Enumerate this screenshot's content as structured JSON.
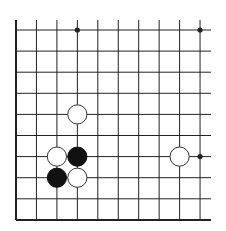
{
  "board": {
    "title": "Go board diagram (partial view)",
    "columns": 10,
    "rows": 10,
    "origin_x": 16,
    "origin_y": 30,
    "spacing_x": 20.45,
    "spacing_y": 21.1,
    "line_color": "#222222",
    "edges": {
      "left": true,
      "bottom": true,
      "top": false,
      "right": false
    },
    "star_points": [
      {
        "col": 3,
        "row": 0
      },
      {
        "col": 9,
        "row": 0
      },
      {
        "col": 9,
        "row": 6
      }
    ],
    "stones": [
      {
        "color": "white",
        "col": 3,
        "row": 4
      },
      {
        "color": "white",
        "col": 2,
        "row": 6
      },
      {
        "color": "black",
        "col": 3,
        "row": 6
      },
      {
        "color": "black",
        "col": 2,
        "row": 7
      },
      {
        "color": "white",
        "col": 3,
        "row": 7
      },
      {
        "color": "white",
        "col": 8,
        "row": 6
      }
    ],
    "stone_colors": {
      "black": "#111111",
      "white": "#ffffff",
      "outline": "#333333"
    }
  }
}
